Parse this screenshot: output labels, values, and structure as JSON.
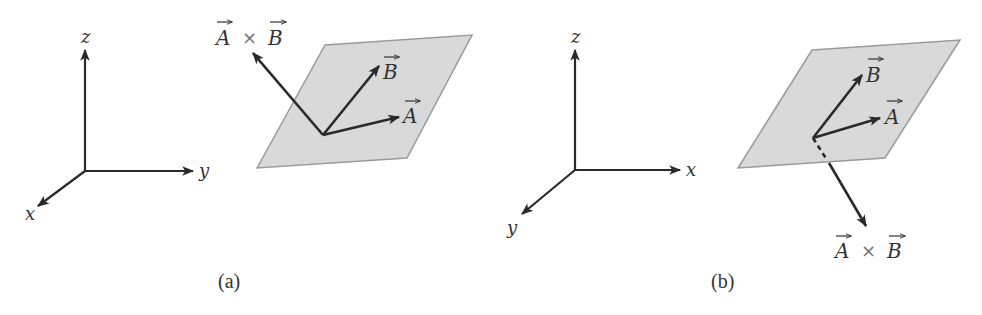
{
  "figure": {
    "panels": [
      {
        "id": "a",
        "caption": "(a)",
        "axes": {
          "vertical": "z",
          "horizontal": "y",
          "diagonal": "x"
        },
        "vectors": {
          "a": "A",
          "b": "B"
        },
        "cross_product": {
          "left": "A",
          "op": "×",
          "right": "B",
          "direction": "up (out of plane, above)"
        }
      },
      {
        "id": "b",
        "caption": "(b)",
        "axes": {
          "vertical": "z",
          "horizontal": "x",
          "diagonal": "y"
        },
        "vectors": {
          "a": "A",
          "b": "B"
        },
        "cross_product": {
          "left": "A",
          "op": "×",
          "right": "B",
          "direction": "down (out of plane, below)"
        }
      }
    ],
    "colors": {
      "ink": "#2a2a2a",
      "plane_fill": "#d9d9d9",
      "plane_edge": "#9a9a9a"
    }
  }
}
